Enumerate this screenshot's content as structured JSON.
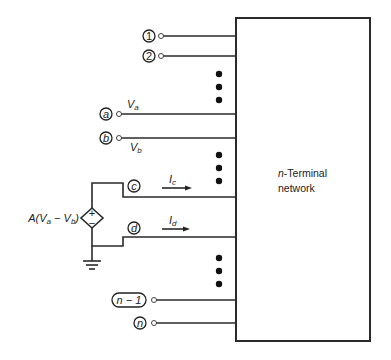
{
  "network": {
    "title_prefix": "n",
    "title_rest": "-Terminal",
    "title_line2": "network"
  },
  "terminals": [
    {
      "id": "1",
      "label": "1",
      "y": 36
    },
    {
      "id": "2",
      "label": "2",
      "y": 56
    },
    {
      "id": "a",
      "label": "a",
      "y": 114,
      "voltage": "V",
      "voltage_sub": "a"
    },
    {
      "id": "b",
      "label": "b",
      "y": 138,
      "voltage": "V",
      "voltage_sub": "b"
    },
    {
      "id": "c",
      "label": "c",
      "y": 197,
      "current": "I",
      "current_sub": "c"
    },
    {
      "id": "d",
      "label": "d",
      "y": 237,
      "current": "I",
      "current_sub": "d"
    },
    {
      "id": "n-1",
      "label": "n − 1",
      "y": 300
    },
    {
      "id": "n",
      "label": "n",
      "y": 323
    }
  ],
  "source": {
    "label_A": "A(V",
    "label_sub_a": "a",
    "label_minus": " − V",
    "label_sub_b": "b",
    "label_close": ")",
    "plus": "+",
    "minus": "−"
  },
  "ellipsis_groups": [
    {
      "y": [
        74,
        87,
        100
      ]
    },
    {
      "y": [
        155,
        168,
        181
      ]
    },
    {
      "y": [
        258,
        271,
        284
      ]
    }
  ]
}
